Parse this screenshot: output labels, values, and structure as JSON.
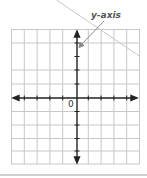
{
  "diagram": {
    "annotation": {
      "text": "y-axis",
      "points_to": "y-axis"
    },
    "origin_label": "0",
    "grid": {
      "columns": 10,
      "rows": 10
    },
    "colors": {
      "grid_line": "#c8c8c8",
      "axis": "#222222",
      "annotation_text": "#555555",
      "pointer": "#8a8a8a"
    }
  }
}
